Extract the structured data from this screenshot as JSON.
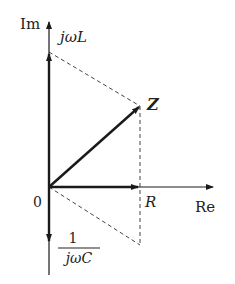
{
  "diagram": {
    "type": "phasor-diagram",
    "axes": {
      "horizontal_label": "Re",
      "vertical_label": "Im",
      "origin_label": "0"
    },
    "vectors": [
      {
        "name": "inductive-reactance",
        "label": "jωL",
        "direction": "up"
      },
      {
        "name": "resistance",
        "label": "R",
        "direction": "right"
      },
      {
        "name": "capacitive-reactance",
        "label_numerator": "1",
        "label_denominator": "jωC",
        "direction": "down"
      },
      {
        "name": "impedance",
        "label": "Z",
        "direction": "diagonal"
      }
    ],
    "colors": {
      "line": "#1a1a1a",
      "dashed": "#444444",
      "text": "#222222"
    }
  }
}
